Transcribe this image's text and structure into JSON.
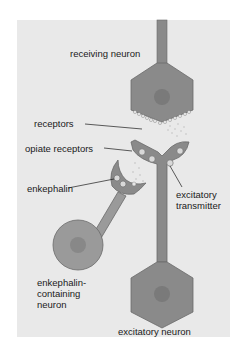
{
  "diagram": {
    "type": "neuron-synapse illustration",
    "labels": {
      "receiving_neuron": "receiving neuron",
      "receptors": "receptors",
      "opiate_receptors": "opiate receptors",
      "enkephalin": "enkephalin",
      "excitatory_transmitter": "excitatory\ntransmitter",
      "enkephalin_neuron": "enkephalin-\ncontaining\nneuron",
      "excitatory_neuron": "excitatory neuron"
    },
    "colors": {
      "background_panel": "#e9e9e9",
      "neuron_fill": "#8a8a8a",
      "enkephalin_neuron_fill": "#9a9a9a",
      "nucleus_fill": "#7a7a7a",
      "outline": "#6a6a6a",
      "molecule_fill": "#d8d8d8"
    }
  }
}
